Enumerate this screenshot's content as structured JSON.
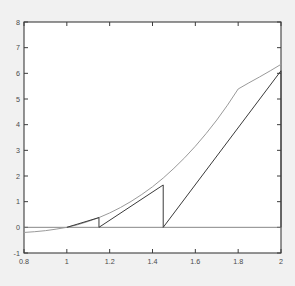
{
  "figure": {
    "background_color": "#f1f1f1",
    "plot_background_color": "#ffffff",
    "frame_color": "#3d3d3d"
  },
  "chart_data": {
    "type": "line",
    "title": "",
    "xlabel": "",
    "ylabel": "",
    "xlim": [
      0.8,
      2.0
    ],
    "ylim": [
      -1,
      8
    ],
    "grid": false,
    "legend": null,
    "x_ticks": [
      0.8,
      1.0,
      1.2,
      1.4,
      1.6,
      1.8,
      2.0
    ],
    "x_tick_labels": [
      "0.8",
      "1",
      "1.2",
      "1.4",
      "1.6",
      "1.8",
      "2"
    ],
    "y_ticks": [
      -1,
      0,
      1,
      2,
      3,
      4,
      5,
      6,
      7,
      8
    ],
    "y_tick_labels": [
      "-1",
      "0",
      "1",
      "2",
      "3",
      "4",
      "5",
      "6",
      "7",
      "8"
    ],
    "series": [
      {
        "name": "curve",
        "type": "line",
        "color": "#9a9a9a",
        "x": [
          0.8,
          0.85,
          0.9,
          0.95,
          1.0,
          1.05,
          1.1,
          1.15,
          1.2,
          1.25,
          1.3,
          1.35,
          1.4,
          1.45,
          1.5,
          1.55,
          1.6,
          1.65,
          1.7,
          1.75,
          1.8,
          1.85,
          1.9,
          1.95,
          2.0
        ],
        "y": [
          -0.2,
          -0.17,
          -0.13,
          -0.07,
          0.0,
          0.1,
          0.23,
          0.38,
          0.56,
          0.77,
          1.01,
          1.28,
          1.58,
          1.92,
          2.3,
          2.71,
          3.16,
          3.65,
          4.18,
          4.76,
          5.39,
          5.63,
          5.86,
          6.1,
          6.35
        ]
      },
      {
        "name": "iteration-polyline",
        "type": "line",
        "color": "#3a3a3a",
        "x": [
          1.0,
          1.15,
          1.15,
          1.45,
          1.45,
          2.0,
          2.0
        ],
        "y": [
          0.0,
          0.38,
          0.0,
          1.65,
          0.0,
          6.1,
          0.0
        ]
      },
      {
        "name": "zero-axis-line",
        "type": "line",
        "color": "#7a7a7a",
        "x": [
          0.8,
          2.0
        ],
        "y": [
          0.0,
          0.0
        ]
      }
    ],
    "annotations": [
      {
        "name": "drop-1",
        "x": 1.15,
        "y_top": 0.38,
        "y_bottom": 0.0
      },
      {
        "name": "drop-2",
        "x": 1.45,
        "y_top": 1.65,
        "y_bottom": 0.0
      },
      {
        "name": "drop-3",
        "x": 2.0,
        "y_top": 6.1,
        "y_bottom": 0.0
      }
    ]
  }
}
